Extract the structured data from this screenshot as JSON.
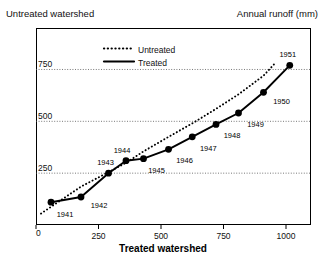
{
  "header": {
    "left_label": "Untreated watershed",
    "right_label": "Annual runoff (mm)"
  },
  "legend": {
    "entries": [
      {
        "label": "Untreated",
        "style": "dotted",
        "color": "#000000"
      },
      {
        "label": "Treated",
        "style": "solid",
        "color": "#000000"
      }
    ]
  },
  "axes": {
    "x_title": "Treated watershed",
    "x_ticks": [
      "0",
      "250",
      "500",
      "750",
      "1000"
    ],
    "y_ticks": [
      "0",
      "250",
      "500",
      "750"
    ]
  },
  "chart_data": {
    "type": "scatter",
    "title": "",
    "subtitle": "",
    "xlabel": "Treated watershed",
    "ylabel": "Untreated watershed",
    "unit_note": "Annual runoff (mm)",
    "xlim": [
      0,
      1100
    ],
    "ylim": [
      0,
      950
    ],
    "grid": true,
    "grid_axis": "y",
    "legend_position": "top-center",
    "point_labels": [
      "1941",
      "1942",
      "1943",
      "1944",
      "1945",
      "1946",
      "1947",
      "1948",
      "1949",
      "1950",
      "1951"
    ],
    "series": [
      {
        "name": "Treated",
        "style": "solid",
        "marker": "filled-circle",
        "x": [
          60,
          180,
          290,
          360,
          430,
          530,
          625,
          720,
          810,
          910,
          1015
        ],
        "y": [
          110,
          135,
          250,
          310,
          320,
          365,
          425,
          485,
          540,
          640,
          770
        ]
      },
      {
        "name": "Untreated",
        "style": "dotted",
        "marker": "none",
        "x": [
          20,
          180,
          290,
          360,
          430,
          530,
          625,
          720,
          810,
          910,
          960
        ],
        "y": [
          55,
          185,
          255,
          300,
          355,
          425,
          490,
          560,
          630,
          720,
          785
        ]
      }
    ]
  }
}
